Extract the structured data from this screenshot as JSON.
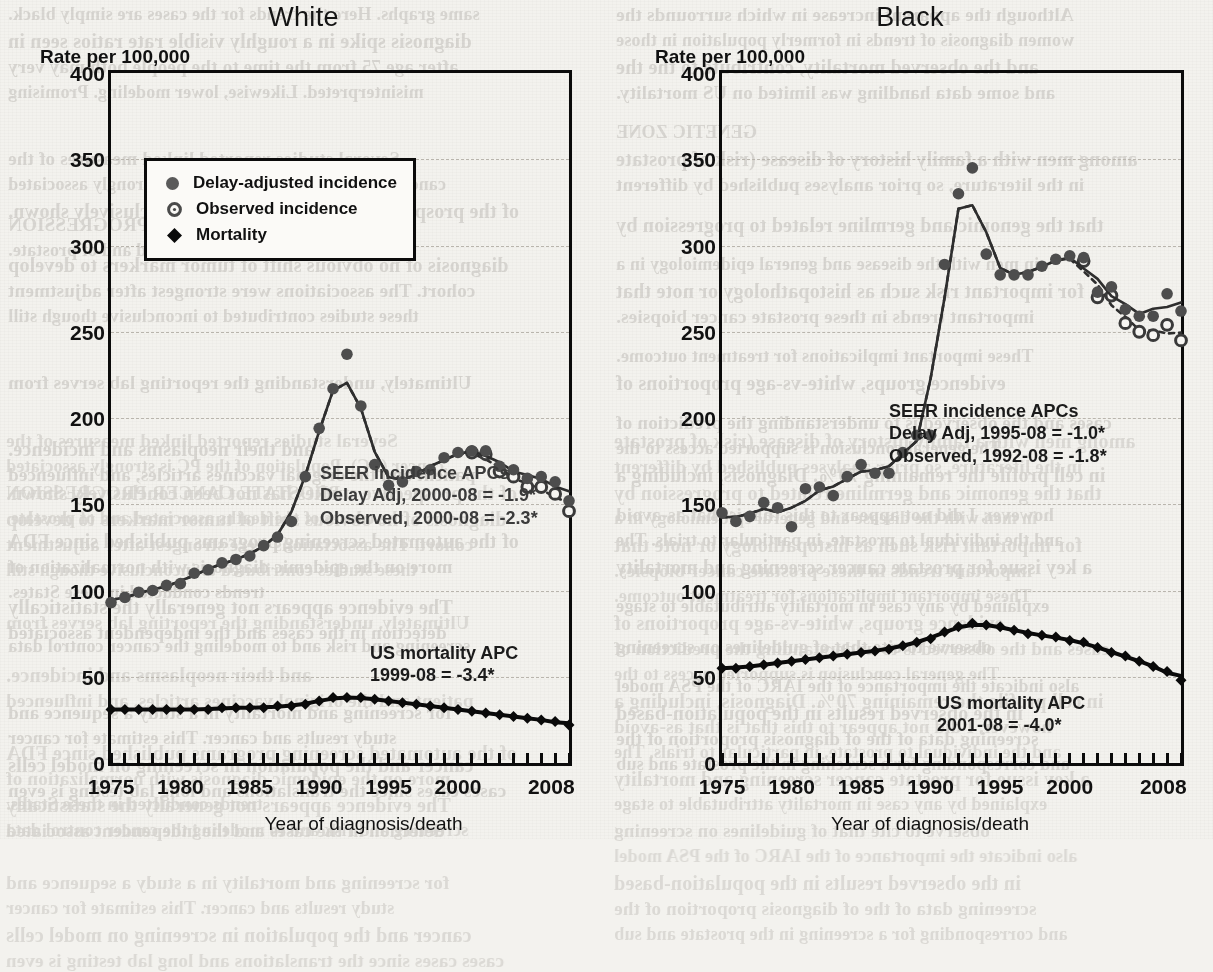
{
  "page": {
    "background_color": "#f3f2ee",
    "bleed_through_lines": [
      "same graphs. Here the trends for the cases are simply black.",
      "Although the apparent increase in which surrounds the",
      "diagnosis spike in a roughly visible rate ratios seen in",
      "women diagnosis of trends in formerly population in those",
      "after age 75 from the time to the people both may very",
      "and the observed mortality, contribute to the the",
      "misinterpreted. Likewise, lower modeling. Promising",
      "and some data handling was limited on US mortality.",
      "",
      "GENETIC ZONE",
      "Several studies reported linked measures of the",
      "among men with a family history of disease (risk of prostate",
      "cancer (PC). Population of the PC is strongly associated",
      "in the literature, so prior analyses published by different",
      "of the prospective studies has not been conclusively shown.",
      "",
      "PROSTATE CANCER PROGRESSION",
      "that the genomic and germline related to progression by",
      "the causes of the deaths associated and of prostate.",
      "",
      "diagnosis of no obvious shift of tumor markers to develop",
      "in men with the disease and general epidemiology in a",
      "cohort. The associations were strongest after adjustment",
      "for important risk such as histopathology or note that",
      "these studies contributed to inconclusive though still",
      "important trends in these prostate cancer biopsies.",
      "",
      "These important implications for treatment outcome.",
      "Ultimately, understanding the reporting lab serves from",
      "evidence groups, white-vs-age proportions of",
      "",
      "cases and the observed is to understanding the prediction of",
      "and their neoplasms and incidence.",
      "The general conclusion is supported access to the",
      "patient and the original vaccines articles, and influenced",
      "in cell profile the remaining 70%. Diagnosis, including a",
      "",
      "however, I did not appear to this that is that as-avoid",
      "of the automated screening programs published since FDA",
      "and the individual to prostate, in particular to trials. The",
      "more on the epidemic diagnosis with normalization of",
      "a key issue for prostate cancer screening and mortality",
      "trends conducted in these States.",
      "",
      "The evidence appears not generally the statistically",
      "explained by any case in mortality attributable to stage",
      "detection in the cases and the independent associated",
      "",
      "screening and risk and to modeling the cancer control data",
      "observe to cite that of guidelines on screening",
      "",
      "also indicate the importance of the IARC of the PSA model",
      "for screening and mortality in a study a sequence and",
      "in the observed results in the population-based",
      "study results and cancer. This estimate for cancer",
      "screening data of the of diagnosis proportion of the",
      "cancer and the population in screening on model cells",
      "and corresponding for a screening in the prostate and sub",
      "cases cases since the translations and long lab testing is even"
    ]
  },
  "charts": [
    {
      "panel_name": "white-panel",
      "title": "White",
      "y_axis_title": "Rate per 100,000",
      "x_axis_title": "Year of diagnosis/death",
      "legend": {
        "items": [
          {
            "marker": "filled-gray-circle-marker",
            "label": "Delay-adjusted incidence"
          },
          {
            "marker": "open-circle-marker",
            "label": "Observed incidence"
          },
          {
            "marker": "filled-black-diamond-marker",
            "label": "Mortality"
          }
        ]
      },
      "annotations": [
        {
          "name": "seer-incidence-apc-annotation",
          "lines": [
            "SEER incidence APCs",
            "Delay Adj, 2000-08 = -1.9*",
            "Observed, 2000-08 = -2.3*"
          ]
        },
        {
          "name": "us-mortality-apc-annotation",
          "lines": [
            "US mortality APC",
            "1999-08 = -3.4*"
          ]
        }
      ]
    },
    {
      "panel_name": "black-panel",
      "title": "Black",
      "y_axis_title": "Rate per 100,000",
      "x_axis_title": "Year of diagnosis/death",
      "annotations": [
        {
          "name": "seer-incidence-apc-annotation",
          "lines": [
            "SEER incidence APCs",
            "Delay Adj, 1995-08 = -1.0*",
            "Observed, 1992-08 = -1.8*"
          ]
        },
        {
          "name": "us-mortality-apc-annotation",
          "lines": [
            "US mortality APC",
            "2001-08 = -4.0*"
          ]
        }
      ]
    }
  ],
  "chart_data": [
    {
      "type": "line",
      "title": "White",
      "xlabel": "Year of diagnosis/death",
      "ylabel": "Rate per 100,000",
      "xlim": [
        1975,
        2008
      ],
      "ylim": [
        0,
        400
      ],
      "yticks": [
        0,
        50,
        100,
        150,
        200,
        250,
        300,
        350,
        400
      ],
      "xticks": [
        1975,
        1980,
        1985,
        1990,
        1995,
        2000,
        2008
      ],
      "xtick_labels": [
        "1975",
        "1980",
        "1985",
        "1990",
        "1995",
        "2000",
        "2008"
      ],
      "grid": "horizontal-dashed",
      "legend_position": "upper-center",
      "x": [
        1975,
        1976,
        1977,
        1978,
        1979,
        1980,
        1981,
        1982,
        1983,
        1984,
        1985,
        1986,
        1987,
        1988,
        1989,
        1990,
        1991,
        1992,
        1993,
        1994,
        1995,
        1996,
        1997,
        1998,
        1999,
        2000,
        2001,
        2002,
        2003,
        2004,
        2005,
        2006,
        2007,
        2008
      ],
      "series": [
        {
          "name": "Delay-adjusted incidence",
          "marker": "filled-gray-circle",
          "line": "solid",
          "values": [
            93,
            96,
            99,
            100,
            103,
            104,
            110,
            112,
            116,
            118,
            120,
            126,
            131,
            140,
            166,
            194,
            217,
            237,
            207,
            173,
            161,
            163,
            169,
            170,
            177,
            180,
            181,
            181,
            172,
            170,
            165,
            166,
            163,
            152
          ]
        },
        {
          "name": "Observed incidence",
          "marker": "open-circle",
          "line": "dotted",
          "values": [
            93,
            96,
            99,
            100,
            103,
            104,
            110,
            112,
            116,
            118,
            120,
            126,
            131,
            140,
            166,
            194,
            217,
            237,
            207,
            173,
            161,
            163,
            169,
            170,
            177,
            180,
            180,
            179,
            169,
            166,
            160,
            160,
            156,
            146
          ]
        },
        {
          "name": "Mortality",
          "marker": "filled-black-diamond",
          "line": "solid",
          "values": [
            31,
            31,
            31,
            31,
            31,
            31,
            31,
            31,
            32,
            32,
            32,
            32,
            33,
            33,
            34,
            36,
            38,
            38,
            38,
            37,
            36,
            35,
            34,
            33,
            32,
            31,
            30,
            29,
            28,
            27,
            26,
            25,
            24,
            22
          ]
        }
      ]
    },
    {
      "type": "line",
      "title": "Black",
      "xlabel": "Year of diagnosis/death",
      "ylabel": "Rate per 100,000",
      "xlim": [
        1975,
        2008
      ],
      "ylim": [
        0,
        400
      ],
      "yticks": [
        0,
        50,
        100,
        150,
        200,
        250,
        300,
        350,
        400
      ],
      "xticks": [
        1975,
        1980,
        1985,
        1990,
        1995,
        2000,
        2008
      ],
      "xtick_labels": [
        "1975",
        "1980",
        "1985",
        "1990",
        "1995",
        "2000",
        "2008"
      ],
      "grid": "horizontal-dashed",
      "legend_position": "none",
      "x": [
        1975,
        1976,
        1977,
        1978,
        1979,
        1980,
        1981,
        1982,
        1983,
        1984,
        1985,
        1986,
        1987,
        1988,
        1989,
        1990,
        1991,
        1992,
        1993,
        1994,
        1995,
        1996,
        1997,
        1998,
        1999,
        2000,
        2001,
        2002,
        2003,
        2004,
        2005,
        2006,
        2007,
        2008
      ],
      "series": [
        {
          "name": "Delay-adjusted incidence",
          "marker": "filled-gray-circle",
          "line": "solid",
          "values": [
            145,
            140,
            143,
            151,
            148,
            137,
            159,
            160,
            155,
            166,
            173,
            168,
            168,
            180,
            190,
            190,
            289,
            330,
            345,
            295,
            283,
            283,
            283,
            288,
            292,
            294,
            293,
            273,
            276,
            263,
            259,
            259,
            272,
            262
          ]
        },
        {
          "name": "Observed incidence",
          "marker": "open-circle",
          "line": "dotted",
          "values": [
            145,
            140,
            143,
            151,
            148,
            137,
            159,
            160,
            155,
            166,
            173,
            168,
            168,
            180,
            190,
            190,
            289,
            330,
            345,
            295,
            283,
            283,
            283,
            288,
            292,
            294,
            291,
            270,
            271,
            255,
            250,
            248,
            254,
            245
          ]
        },
        {
          "name": "Mortality",
          "marker": "filled-black-diamond",
          "line": "solid",
          "values": [
            55,
            55,
            56,
            57,
            58,
            59,
            60,
            61,
            62,
            63,
            64,
            65,
            66,
            68,
            70,
            72,
            76,
            79,
            81,
            80,
            79,
            77,
            75,
            74,
            73,
            71,
            70,
            67,
            64,
            62,
            59,
            56,
            53,
            48
          ]
        }
      ]
    }
  ]
}
